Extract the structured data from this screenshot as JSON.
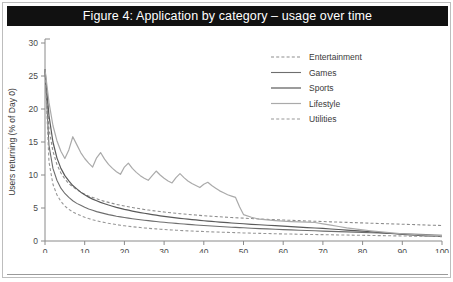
{
  "figure": {
    "title": "Figure 4: Application by category – usage over time",
    "title_bar_color": "#111111",
    "title_text_color": "#ffffff",
    "frame_border_color": "#bdbdbd",
    "footer_partial_text": ""
  },
  "chart_data": {
    "type": "line",
    "title": "Figure 4: Application by category – usage over time",
    "xlabel": "Day since first use",
    "ylabel": "Users returning (% of Day 0)",
    "xlim": [
      0,
      100
    ],
    "ylim": [
      0,
      30
    ],
    "xticks": [
      0,
      10,
      20,
      30,
      40,
      50,
      60,
      70,
      80,
      90,
      100
    ],
    "yticks": [
      0,
      5,
      10,
      15,
      20,
      25,
      30
    ],
    "grid": false,
    "legend_position": "top-right",
    "x": [
      0,
      1,
      2,
      3,
      4,
      5,
      6,
      7,
      8,
      9,
      10,
      11,
      12,
      13,
      14,
      15,
      16,
      17,
      18,
      19,
      20,
      21,
      22,
      23,
      24,
      25,
      26,
      27,
      28,
      29,
      30,
      31,
      32,
      33,
      34,
      35,
      36,
      37,
      38,
      39,
      40,
      41,
      42,
      43,
      44,
      45,
      46,
      47,
      48,
      49,
      50,
      52,
      54,
      56,
      58,
      60,
      62,
      64,
      66,
      68,
      70,
      72,
      74,
      76,
      78,
      80,
      82,
      84,
      86,
      88,
      90,
      92,
      94,
      96,
      98,
      100
    ],
    "series": [
      {
        "name": "Entertainment",
        "style": "dashed",
        "color": "#8d8d8d",
        "width": 1.1,
        "values": [
          26.0,
          17.0,
          13.6,
          11.6,
          10.3,
          9.4,
          8.7,
          8.2,
          7.8,
          7.4,
          7.1,
          6.8,
          6.6,
          6.4,
          6.2,
          6.0,
          5.85,
          5.7,
          5.55,
          5.42,
          5.3,
          5.18,
          5.07,
          4.97,
          4.87,
          4.78,
          4.69,
          4.61,
          4.53,
          4.46,
          4.39,
          4.32,
          4.26,
          4.2,
          4.14,
          4.08,
          4.03,
          3.98,
          3.93,
          3.88,
          3.83,
          3.79,
          3.75,
          3.71,
          3.67,
          3.63,
          3.59,
          3.55,
          3.52,
          3.49,
          3.46,
          3.4,
          3.34,
          3.28,
          3.23,
          3.18,
          3.13,
          3.08,
          3.03,
          2.99,
          2.95,
          2.9,
          2.86,
          2.82,
          2.78,
          2.74,
          2.7,
          2.66,
          2.62,
          2.58,
          2.54,
          2.5,
          2.46,
          2.42,
          2.38,
          2.35
        ]
      },
      {
        "name": "Games",
        "style": "solid",
        "color": "#6e6e6e",
        "width": 1.1,
        "values": [
          26.0,
          14.5,
          11.0,
          9.2,
          8.0,
          7.2,
          6.6,
          6.1,
          5.7,
          5.4,
          5.1,
          4.85,
          4.65,
          4.45,
          4.3,
          4.15,
          4.0,
          3.88,
          3.76,
          3.66,
          3.56,
          3.47,
          3.38,
          3.3,
          3.22,
          3.15,
          3.08,
          3.01,
          2.95,
          2.89,
          2.83,
          2.77,
          2.72,
          2.67,
          2.62,
          2.57,
          2.52,
          2.48,
          2.43,
          2.39,
          2.35,
          2.31,
          2.27,
          2.23,
          2.2,
          2.16,
          2.13,
          2.09,
          2.06,
          2.03,
          2.0,
          1.94,
          1.88,
          1.83,
          1.78,
          1.73,
          1.68,
          1.63,
          1.59,
          1.55,
          1.5,
          1.46,
          1.42,
          1.38,
          1.34,
          1.3,
          1.25,
          1.21,
          1.17,
          1.13,
          1.09,
          1.05,
          1.0,
          0.96,
          0.92,
          0.88
        ]
      },
      {
        "name": "Sports",
        "style": "solid",
        "color": "#5a5a5a",
        "width": 1.2,
        "values": [
          26.0,
          19.0,
          15.0,
          12.6,
          11.0,
          9.9,
          9.1,
          8.4,
          7.9,
          7.4,
          7.0,
          6.65,
          6.35,
          6.1,
          5.85,
          5.65,
          5.45,
          5.27,
          5.1,
          4.95,
          4.8,
          4.67,
          4.54,
          4.42,
          4.31,
          4.2,
          4.1,
          4.0,
          3.91,
          3.82,
          3.74,
          3.66,
          3.58,
          3.51,
          3.44,
          3.37,
          3.31,
          3.25,
          3.19,
          3.13,
          3.07,
          3.02,
          2.97,
          2.92,
          2.87,
          2.82,
          2.77,
          2.73,
          2.69,
          2.65,
          2.61,
          2.53,
          2.46,
          2.39,
          2.32,
          2.25,
          2.18,
          2.11,
          2.04,
          1.97,
          1.9,
          1.82,
          1.74,
          1.66,
          1.58,
          1.5,
          1.4,
          1.3,
          1.2,
          1.1,
          1.0,
          0.92,
          0.85,
          0.78,
          0.72,
          0.68
        ]
      },
      {
        "name": "Lifestyle",
        "style": "solid",
        "color": "#aaaaaa",
        "width": 1.2,
        "values": [
          26.0,
          21.0,
          17.5,
          15.2,
          13.6,
          12.5,
          13.8,
          15.8,
          14.6,
          13.4,
          12.5,
          11.8,
          11.2,
          12.6,
          13.4,
          12.4,
          11.6,
          11.0,
          10.5,
          10.1,
          11.2,
          11.8,
          11.0,
          10.4,
          9.9,
          9.5,
          9.2,
          9.9,
          10.6,
          10.0,
          9.5,
          9.1,
          8.8,
          9.6,
          10.2,
          9.6,
          9.1,
          8.7,
          8.4,
          8.1,
          8.6,
          8.9,
          8.4,
          8.0,
          7.6,
          7.3,
          7.0,
          6.8,
          6.6,
          5.2,
          4.0,
          3.6,
          3.3,
          3.2,
          3.1,
          3.0,
          2.95,
          2.9,
          2.85,
          2.8,
          2.6,
          2.4,
          2.2,
          2.0,
          1.85,
          1.7,
          1.55,
          1.42,
          1.3,
          1.2,
          1.1,
          1.02,
          0.95,
          0.9,
          0.86,
          0.82
        ]
      },
      {
        "name": "Utilities",
        "style": "dashed",
        "color": "#979797",
        "width": 1.1,
        "values": [
          26.0,
          12.0,
          8.6,
          7.0,
          6.0,
          5.3,
          4.8,
          4.4,
          4.1,
          3.85,
          3.6,
          3.4,
          3.22,
          3.06,
          2.92,
          2.8,
          2.68,
          2.58,
          2.48,
          2.39,
          2.31,
          2.23,
          2.16,
          2.1,
          2.04,
          1.98,
          1.93,
          1.88,
          1.83,
          1.79,
          1.75,
          1.71,
          1.67,
          1.64,
          1.6,
          1.57,
          1.54,
          1.51,
          1.48,
          1.46,
          1.43,
          1.41,
          1.38,
          1.36,
          1.34,
          1.32,
          1.3,
          1.28,
          1.26,
          1.24,
          1.22,
          1.19,
          1.16,
          1.13,
          1.1,
          1.07,
          1.05,
          1.02,
          1.0,
          0.98,
          0.96,
          0.94,
          0.92,
          0.9,
          0.88,
          0.86,
          0.84,
          0.82,
          0.8,
          0.78,
          0.76,
          0.74,
          0.72,
          0.7,
          0.68,
          0.66
        ]
      }
    ]
  },
  "legend": {
    "items": [
      {
        "label": "Entertainment"
      },
      {
        "label": "Games"
      },
      {
        "label": "Sports"
      },
      {
        "label": "Lifestyle"
      },
      {
        "label": "Utilities"
      }
    ]
  }
}
